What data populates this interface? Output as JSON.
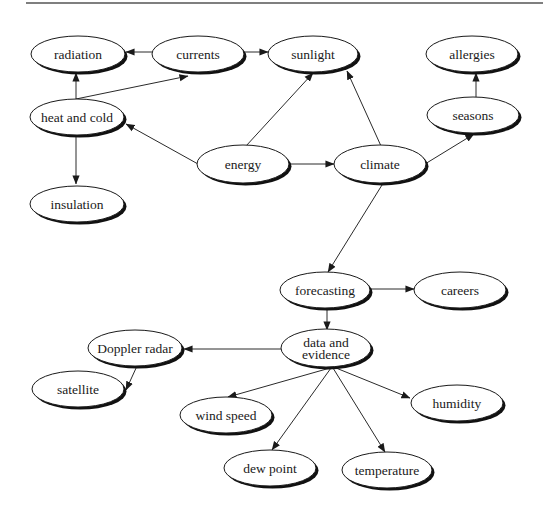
{
  "diagram": {
    "type": "concept-map",
    "colors": {
      "node_fill": "#ffffff",
      "node_stroke": "#1a1a1a",
      "shadow": "#111111",
      "edge": "#2a2a2a",
      "rule": "#555555"
    },
    "rule": {
      "x1": 26,
      "y1": 3,
      "x2": 543,
      "y2": 3
    },
    "nodes": [
      {
        "id": "radiation",
        "lines": [
          "radiation"
        ],
        "cx": 78,
        "cy": 54,
        "rx": 47,
        "ry": 18
      },
      {
        "id": "currents",
        "lines": [
          "currents"
        ],
        "cx": 198,
        "cy": 54,
        "rx": 46,
        "ry": 18
      },
      {
        "id": "sunlight",
        "lines": [
          "sunlight"
        ],
        "cx": 313,
        "cy": 54,
        "rx": 45,
        "ry": 18
      },
      {
        "id": "allergies",
        "lines": [
          "allergies"
        ],
        "cx": 472,
        "cy": 54,
        "rx": 46,
        "ry": 18
      },
      {
        "id": "heat-and-cold",
        "lines": [
          "heat and cold"
        ],
        "cx": 77,
        "cy": 117,
        "rx": 47,
        "ry": 18
      },
      {
        "id": "seasons",
        "lines": [
          "seasons"
        ],
        "cx": 473,
        "cy": 115,
        "rx": 46,
        "ry": 18
      },
      {
        "id": "energy",
        "lines": [
          "energy"
        ],
        "cx": 243,
        "cy": 164,
        "rx": 46,
        "ry": 19
      },
      {
        "id": "climate",
        "lines": [
          "climate"
        ],
        "cx": 380,
        "cy": 164,
        "rx": 46,
        "ry": 19
      },
      {
        "id": "insulation",
        "lines": [
          "insulation"
        ],
        "cx": 77,
        "cy": 204,
        "rx": 47,
        "ry": 18
      },
      {
        "id": "forecasting",
        "lines": [
          "forecasting"
        ],
        "cx": 325,
        "cy": 290,
        "rx": 45,
        "ry": 18
      },
      {
        "id": "careers",
        "lines": [
          "careers"
        ],
        "cx": 460,
        "cy": 290,
        "rx": 46,
        "ry": 18
      },
      {
        "id": "data-and-evidence",
        "lines": [
          "data and",
          "evidence"
        ],
        "cx": 326,
        "cy": 348,
        "rx": 45,
        "ry": 19
      },
      {
        "id": "doppler-radar",
        "lines": [
          "Doppler radar"
        ],
        "cx": 135,
        "cy": 348,
        "rx": 47,
        "ry": 18
      },
      {
        "id": "satellite",
        "lines": [
          "satellite"
        ],
        "cx": 78,
        "cy": 389,
        "rx": 46,
        "ry": 18
      },
      {
        "id": "wind-speed",
        "lines": [
          "wind speed"
        ],
        "cx": 226,
        "cy": 415,
        "rx": 46,
        "ry": 18
      },
      {
        "id": "humidity",
        "lines": [
          "humidity"
        ],
        "cx": 457,
        "cy": 403,
        "rx": 46,
        "ry": 18
      },
      {
        "id": "dew-point",
        "lines": [
          "dew point"
        ],
        "cx": 270,
        "cy": 468,
        "rx": 46,
        "ry": 18
      },
      {
        "id": "temperature",
        "lines": [
          "temperature"
        ],
        "cx": 387,
        "cy": 470,
        "rx": 45,
        "ry": 18
      }
    ],
    "edges": [
      {
        "from": "currents",
        "to": "radiation",
        "x1": 152,
        "y1": 52,
        "x2": 126,
        "y2": 52
      },
      {
        "from": "currents",
        "to": "sunlight",
        "x1": 244,
        "y1": 52,
        "x2": 268,
        "y2": 52
      },
      {
        "from": "heat-and-cold",
        "to": "radiation",
        "x1": 76,
        "y1": 99,
        "x2": 76,
        "y2": 73
      },
      {
        "from": "heat-and-cold",
        "to": "currents",
        "x1": 76,
        "y1": 99,
        "x2": 188,
        "y2": 76
      },
      {
        "from": "heat-and-cold",
        "to": "insulation",
        "x1": 76,
        "y1": 136,
        "x2": 76,
        "y2": 184
      },
      {
        "from": "energy",
        "to": "heat-and-cold",
        "x1": 198,
        "y1": 164,
        "x2": 126,
        "y2": 124
      },
      {
        "from": "energy",
        "to": "sunlight",
        "x1": 246,
        "y1": 146,
        "x2": 313,
        "y2": 73
      },
      {
        "from": "energy",
        "to": "climate",
        "x1": 290,
        "y1": 164,
        "x2": 334,
        "y2": 164
      },
      {
        "from": "climate",
        "to": "sunlight",
        "x1": 381,
        "y1": 146,
        "x2": 347,
        "y2": 71
      },
      {
        "from": "climate",
        "to": "seasons",
        "x1": 425,
        "y1": 164,
        "x2": 474,
        "y2": 134
      },
      {
        "from": "seasons",
        "to": "allergies",
        "x1": 476,
        "y1": 97,
        "x2": 476,
        "y2": 73
      },
      {
        "from": "climate",
        "to": "forecasting",
        "x1": 382,
        "y1": 185,
        "x2": 328,
        "y2": 272
      },
      {
        "from": "forecasting",
        "to": "careers",
        "x1": 371,
        "y1": 289,
        "x2": 414,
        "y2": 289
      },
      {
        "from": "forecasting",
        "to": "data-and-evidence",
        "x1": 327,
        "y1": 309,
        "x2": 327,
        "y2": 330
      },
      {
        "from": "data-and-evidence",
        "to": "doppler-radar",
        "x1": 281,
        "y1": 349,
        "x2": 184,
        "y2": 349
      },
      {
        "from": "doppler-radar",
        "to": "satellite",
        "x1": 137,
        "y1": 366,
        "x2": 126,
        "y2": 390
      },
      {
        "from": "data-and-evidence",
        "to": "wind-speed",
        "x1": 330,
        "y1": 368,
        "x2": 228,
        "y2": 397
      },
      {
        "from": "data-and-evidence",
        "to": "dew-point",
        "x1": 331,
        "y1": 368,
        "x2": 272,
        "y2": 450
      },
      {
        "from": "data-and-evidence",
        "to": "temperature",
        "x1": 333,
        "y1": 368,
        "x2": 385,
        "y2": 452
      },
      {
        "from": "data-and-evidence",
        "to": "humidity",
        "x1": 336,
        "y1": 368,
        "x2": 410,
        "y2": 398
      }
    ]
  }
}
